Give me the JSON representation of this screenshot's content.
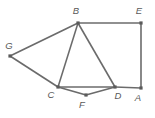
{
  "figure": {
    "type": "undirected-graph-diagram",
    "width": 155,
    "height": 118,
    "background_color": "#ffffff",
    "edge_color": "#6b6b6b",
    "edge_width": 1.6,
    "vertex_color": "#5a5a5a",
    "vertex_size": 3.2,
    "label_color": "#595959",
    "label_font_size": 9.5
  },
  "vertices": [
    {
      "id": "A",
      "label": "A",
      "x": 141,
      "y": 88,
      "label_x": 138,
      "label_y": 101,
      "label_anchor": "middle"
    },
    {
      "id": "B",
      "label": "B",
      "x": 78,
      "y": 23,
      "label_x": 76,
      "label_y": 14,
      "label_anchor": "middle"
    },
    {
      "id": "C",
      "label": "C",
      "x": 58,
      "y": 87,
      "label_x": 51,
      "label_y": 98,
      "label_anchor": "middle"
    },
    {
      "id": "D",
      "label": "D",
      "x": 115,
      "y": 87,
      "label_x": 118,
      "label_y": 99,
      "label_anchor": "middle"
    },
    {
      "id": "E",
      "label": "E",
      "x": 141,
      "y": 23,
      "label_x": 139,
      "label_y": 14,
      "label_anchor": "middle"
    },
    {
      "id": "F",
      "label": "F",
      "x": 86,
      "y": 95,
      "label_x": 82,
      "label_y": 108,
      "label_anchor": "middle"
    },
    {
      "id": "G",
      "label": "G",
      "x": 10,
      "y": 56,
      "label_x": 9,
      "label_y": 49,
      "label_anchor": "middle"
    }
  ],
  "edges": [
    {
      "id": "B-E",
      "from": "B",
      "to": "E"
    },
    {
      "id": "E-A",
      "from": "E",
      "to": "A"
    },
    {
      "id": "D-A",
      "from": "D",
      "to": "A"
    },
    {
      "id": "B-D",
      "from": "B",
      "to": "D"
    },
    {
      "id": "B-C",
      "from": "B",
      "to": "C"
    },
    {
      "id": "B-G",
      "from": "B",
      "to": "G"
    },
    {
      "id": "G-C",
      "from": "G",
      "to": "C"
    },
    {
      "id": "C-D",
      "from": "C",
      "to": "D"
    },
    {
      "id": "C-F",
      "from": "C",
      "to": "F"
    },
    {
      "id": "F-D",
      "from": "F",
      "to": "D"
    }
  ]
}
